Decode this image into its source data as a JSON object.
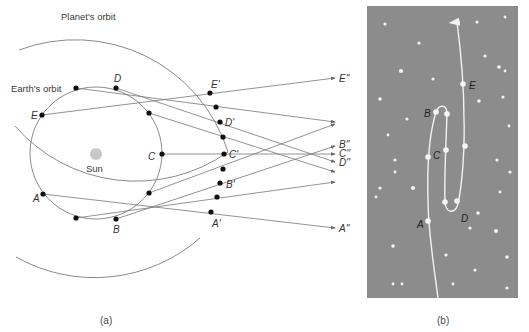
{
  "panel_a": {
    "caption": "(a)",
    "planet_orbit_label": "Planet's orbit",
    "earth_orbit_label": "Earth's orbit",
    "sun_label": "Sun",
    "earth_positions": [
      {
        "label": "A",
        "x": 43,
        "y": 194
      },
      {
        "label": "",
        "x": 76,
        "y": 218
      },
      {
        "label": "B",
        "x": 116,
        "y": 219
      },
      {
        "label": "",
        "x": 149,
        "y": 193
      },
      {
        "label": "C",
        "x": 162,
        "y": 154
      },
      {
        "label": "",
        "x": 149,
        "y": 113
      },
      {
        "label": "D",
        "x": 116,
        "y": 88
      },
      {
        "label": "",
        "x": 76,
        "y": 88
      },
      {
        "label": "E",
        "x": 42,
        "y": 115
      }
    ],
    "planet_positions": [
      {
        "label": "A'",
        "x": 211,
        "y": 212
      },
      {
        "label": "",
        "x": 217,
        "y": 197
      },
      {
        "label": "B'",
        "x": 220,
        "y": 183
      },
      {
        "label": "",
        "x": 223,
        "y": 169
      },
      {
        "label": "C'",
        "x": 224,
        "y": 154
      },
      {
        "label": "",
        "x": 223,
        "y": 137
      },
      {
        "label": "D'",
        "x": 220,
        "y": 122
      },
      {
        "label": "",
        "x": 216,
        "y": 107
      },
      {
        "label": "E'",
        "x": 210,
        "y": 93
      }
    ],
    "projected_labels": [
      {
        "label": "E''",
        "x": 338,
        "y": 80
      },
      {
        "label": "B''",
        "x": 338,
        "y": 146
      },
      {
        "label": "C''",
        "x": 338,
        "y": 155
      },
      {
        "label": "D''",
        "x": 338,
        "y": 164
      },
      {
        "label": "A''",
        "x": 338,
        "y": 230
      }
    ]
  },
  "panel_b": {
    "caption": "(b)",
    "background_color": "#8c8c8c",
    "path_labels": [
      {
        "label": "E",
        "x": 470,
        "y": 87
      },
      {
        "label": "B",
        "x": 423,
        "y": 116
      },
      {
        "label": "C",
        "x": 433,
        "y": 157
      },
      {
        "label": "D",
        "x": 465,
        "y": 221
      },
      {
        "label": "A",
        "x": 417,
        "y": 226
      }
    ]
  }
}
